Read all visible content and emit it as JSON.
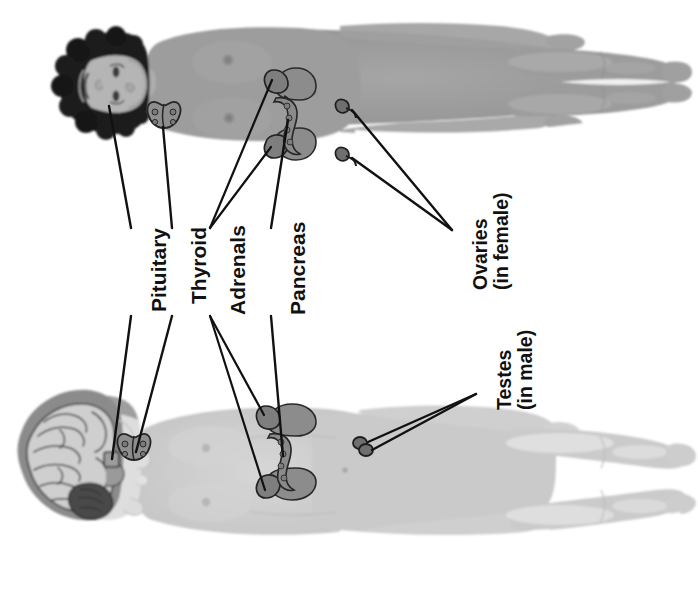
{
  "diagram": {
    "background_color": "#ffffff",
    "orientation": "rotated-90-ccw",
    "line_color": "#111111",
    "figures": [
      {
        "id": "female-figure",
        "sex": "female",
        "position": "top",
        "body_color": "#9a9a9a",
        "body_shadow_color": "#8a8a8a",
        "hair_color": "#1a1a1a",
        "skin_color": "#b3b3b3",
        "description": "Female body lying horizontally, head at left, dark curly hair, face in profile-front view"
      },
      {
        "id": "male-figure",
        "sex": "male",
        "position": "bottom",
        "body_color": "#cdcdcd",
        "body_shadow_color": "#bdbdbd",
        "hair_color": "#8c8c8c",
        "skin_color": "#dedede",
        "description": "Male body lying horizontally, head at left, brain shown in cutaway section"
      }
    ],
    "organ_color": "#8e8e8e",
    "organ_outline": "#2a2a2a",
    "labels": [
      {
        "id": "pituitary",
        "lines": [
          "Pituitary"
        ],
        "text": "Pituitary",
        "organ": "pituitary gland",
        "shown_on": [
          "female-figure",
          "male-figure"
        ],
        "leader_count": 2
      },
      {
        "id": "thyroid",
        "lines": [
          "Thyroid"
        ],
        "text": "Thyroid",
        "organ": "thyroid gland",
        "shown_on": [
          "female-figure",
          "male-figure"
        ],
        "leader_count": 2
      },
      {
        "id": "adrenals",
        "lines": [
          "Adrenals"
        ],
        "text": "Adrenals",
        "organ": "adrenal glands",
        "shown_on": [
          "female-figure",
          "male-figure"
        ],
        "leader_count": 4
      },
      {
        "id": "pancreas",
        "lines": [
          "Pancreas"
        ],
        "text": "Pancreas",
        "organ": "pancreas",
        "shown_on": [
          "female-figure",
          "male-figure"
        ],
        "leader_count": 2
      },
      {
        "id": "ovaries",
        "lines": [
          "Ovaries",
          "(in female)"
        ],
        "text": "Ovaries (in female)",
        "organ": "ovaries",
        "shown_on": [
          "female-figure"
        ],
        "leader_count": 2
      },
      {
        "id": "testes",
        "lines": [
          "Testes",
          "(in male)"
        ],
        "text": "Testes (in male)",
        "organ": "testes",
        "shown_on": [
          "male-figure"
        ],
        "leader_count": 2
      }
    ]
  }
}
